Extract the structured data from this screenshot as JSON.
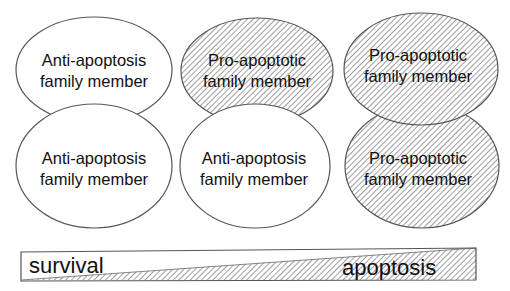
{
  "diagram": {
    "type": "bcl2-family-balance",
    "colors": {
      "stroke": "#555555",
      "hatch": "#6a6a6a",
      "fill_plain": "#ffffff",
      "text": "#111111"
    },
    "columns": [
      {
        "top": {
          "label_line1": "Anti-apoptosis",
          "label_line2": "family member",
          "kind": "anti"
        },
        "bottom": {
          "label_line1": "Anti-apoptosis",
          "label_line2": "family member",
          "kind": "anti"
        }
      },
      {
        "top": {
          "label_line1": "Pro-apoptotic",
          "label_line2": "family member",
          "kind": "pro"
        },
        "bottom": {
          "label_line1": "Anti-apoptosis",
          "label_line2": "family member",
          "kind": "anti"
        }
      },
      {
        "top": {
          "label_line1": "Pro-apoptotic",
          "label_line2": "family member",
          "kind": "pro"
        },
        "bottom": {
          "label_line1": "Pro-apoptotic",
          "label_line2": "family member",
          "kind": "pro"
        }
      }
    ],
    "gradient_bar": {
      "left_label": "survival",
      "right_label": "apoptosis"
    }
  }
}
